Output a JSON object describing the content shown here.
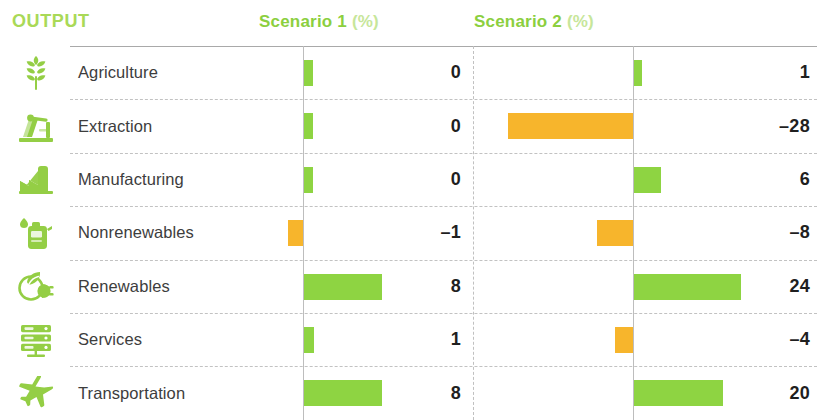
{
  "header": {
    "output_label": "OUTPUT",
    "scenario1_title": "Scenario 1",
    "scenario1_unit": "(%)",
    "scenario2_title": "Scenario 2",
    "scenario2_unit": "(%)"
  },
  "colors": {
    "positive_bar": "#8ed442",
    "negative_bar": "#f7b52c",
    "header_green": "#8ccf3f",
    "header_green_light": "#c7e69a",
    "output_green": "#a9d957",
    "icon_green": "#94ce45",
    "label_text": "#3d3d3d",
    "value_text": "#1f1f1f",
    "rule": "#9a9a9a",
    "dash": "#c2c2c2"
  },
  "rows": [
    {
      "icon": "wheat-icon",
      "label": "Agriculture",
      "s1_text": "0",
      "s2_text": "1"
    },
    {
      "icon": "oil-pump-icon",
      "label": "Extraction",
      "s1_text": "0",
      "s2_text": "–28"
    },
    {
      "icon": "factory-icon",
      "label": "Manufacturing",
      "s1_text": "0",
      "s2_text": "6"
    },
    {
      "icon": "gas-can-icon",
      "label": "Nonrenewables",
      "s1_text": "–1",
      "s2_text": "–8"
    },
    {
      "icon": "leaf-plug-icon",
      "label": "Renewables",
      "s1_text": "8",
      "s2_text": "24"
    },
    {
      "icon": "server-icon",
      "label": "Services",
      "s1_text": "1",
      "s2_text": "–4"
    },
    {
      "icon": "airplane-icon",
      "label": "Transportation",
      "s1_text": "8",
      "s2_text": "20"
    }
  ],
  "chart_data": {
    "type": "bar",
    "title": "OUTPUT",
    "orientation": "horizontal",
    "categories": [
      "Agriculture",
      "Extraction",
      "Manufacturing",
      "Nonrenewables",
      "Renewables",
      "Services",
      "Transportation"
    ],
    "series": [
      {
        "name": "Scenario 1 (%)",
        "values": [
          0,
          0,
          0,
          -1,
          8,
          1,
          8
        ]
      },
      {
        "name": "Scenario 2 (%)",
        "values": [
          1,
          -28,
          6,
          -8,
          24,
          -4,
          20
        ]
      }
    ],
    "xlabel": "",
    "ylabel": "",
    "unit": "%",
    "grid": "dashed horizontal row separators",
    "legend": "none"
  },
  "render": {
    "s1_px_per_unit": 9.8,
    "s1_zero_stub_px": 9,
    "s2_px_per_unit": 4.45,
    "row_height": 53.4,
    "bar_height": 26
  }
}
